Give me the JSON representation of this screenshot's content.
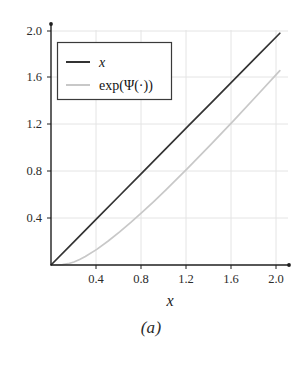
{
  "figure": {
    "caption": "(a)",
    "background_color": "#ffffff"
  },
  "chart_data": {
    "type": "line",
    "title": "",
    "subtitle": "",
    "xlabel": "x",
    "ylabel": "",
    "xlim": [
      0,
      2.08
    ],
    "ylim": [
      0,
      2.08
    ],
    "grid": true,
    "legend_position": "upper-left",
    "xticks": [
      "0.4",
      "0.8",
      "1.2",
      "1.6",
      "2.0"
    ],
    "xtick_values": [
      0.4,
      0.8,
      1.2,
      1.6,
      2.0
    ],
    "yticks": [
      "0.4",
      "0.8",
      "1.2",
      "1.6",
      "2.0"
    ],
    "ytick_values": [
      0.4,
      0.8,
      1.2,
      1.6,
      2.0
    ],
    "series": [
      {
        "name": "x",
        "name_style": "italic",
        "color": "#333333",
        "width": 1.6,
        "x": [
          0.0,
          0.2,
          0.4,
          0.6,
          0.8,
          1.0,
          1.2,
          1.4,
          1.6,
          1.8,
          2.0
        ],
        "values": [
          0.0,
          0.2,
          0.4,
          0.6,
          0.8,
          1.0,
          1.2,
          1.4,
          1.6,
          1.8,
          2.0
        ]
      },
      {
        "name": "exp(Ψ(·))",
        "name_style": "upright",
        "color": "#c8c8c8",
        "width": 1.6,
        "x": [
          0.0,
          0.05,
          0.1,
          0.15,
          0.2,
          0.25,
          0.3,
          0.4,
          0.5,
          0.6,
          0.7,
          0.8,
          0.9,
          1.0,
          1.2,
          1.4,
          1.6,
          1.8,
          2.0
        ],
        "values": [
          0.0,
          0.0001,
          0.0026,
          0.0111,
          0.0262,
          0.0472,
          0.0731,
          0.1351,
          0.2069,
          0.2857,
          0.3699,
          0.4583,
          0.5501,
          0.6447,
          0.8402,
          1.0428,
          1.2507,
          1.4626,
          1.6777
        ]
      }
    ],
    "legend_entries": [
      {
        "label": "x",
        "style": "italic",
        "color": "#333333"
      },
      {
        "label": "exp(Ψ(·))",
        "style": "upright",
        "color": "#c8c8c8"
      }
    ],
    "axis_color": "#1f1f1f",
    "grid_color": "#e2e2e2",
    "legend_border_color": "#3a3a3a"
  }
}
